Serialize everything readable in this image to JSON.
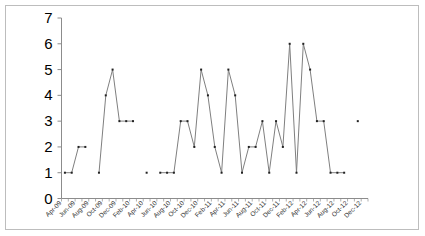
{
  "chart_data": {
    "type": "line",
    "title": "",
    "xlabel": "",
    "ylabel": "",
    "ylim": [
      0,
      7
    ],
    "yticks": [
      0,
      1,
      2,
      3,
      4,
      5,
      6,
      7
    ],
    "grid": false,
    "legend": null,
    "x_tick_labels": [
      "Apr-09",
      "Jun-09",
      "Aug-09",
      "Oct-09",
      "Dec-09",
      "Feb-10",
      "Apr-10",
      "Jun-10",
      "Aug-10",
      "Oct-10",
      "Dec-10",
      "Feb-11",
      "Apr-11",
      "Jun-11",
      "Aug-11",
      "Oct-11",
      "Dec-11",
      "Feb-12",
      "Apr-12",
      "Jun-12",
      "Aug-12",
      "Oct-12",
      "Dec-12"
    ],
    "categories": [
      "Apr-09",
      "May-09",
      "Jun-09",
      "Jul-09",
      "Aug-09",
      "Sep-09",
      "Oct-09",
      "Nov-09",
      "Dec-09",
      "Jan-10",
      "Feb-10",
      "Mar-10",
      "Apr-10",
      "May-10",
      "Jun-10",
      "Jul-10",
      "Aug-10",
      "Sep-10",
      "Oct-10",
      "Nov-10",
      "Dec-10",
      "Jan-11",
      "Feb-11",
      "Mar-11",
      "Apr-11",
      "May-11",
      "Jun-11",
      "Jul-11",
      "Aug-11",
      "Sep-11",
      "Oct-11",
      "Nov-11",
      "Dec-11",
      "Jan-12",
      "Feb-12",
      "Mar-12",
      "Apr-12",
      "May-12",
      "Jun-12",
      "Jul-12",
      "Aug-12",
      "Sep-12",
      "Oct-12",
      "Nov-12",
      "Dec-12"
    ],
    "series": [
      {
        "name": "Series 1",
        "color": "#7f7f7f",
        "values": [
          1,
          1,
          2,
          2,
          null,
          1,
          4,
          5,
          3,
          3,
          3,
          null,
          1,
          null,
          1,
          1,
          1,
          3,
          3,
          2,
          5,
          4,
          2,
          1,
          5,
          4,
          1,
          2,
          2,
          3,
          1,
          3,
          2,
          6,
          1,
          6,
          5,
          3,
          3,
          1,
          1,
          1,
          null,
          3,
          null
        ]
      }
    ]
  }
}
